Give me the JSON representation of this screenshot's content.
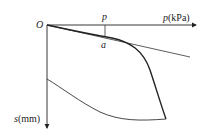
{
  "diagram": {
    "origin_label": "O",
    "x_axis": {
      "symbol": "p",
      "unit": "(kPa)"
    },
    "y_axis": {
      "symbol": "s",
      "unit": "(mm)"
    },
    "marker": {
      "load_label": "p",
      "point_label": "a"
    },
    "curves": [
      {
        "name": "loading-curve",
        "description": "settlement increases with load; linear up to point a, then steeply downward"
      },
      {
        "name": "tangent-line",
        "description": "straight line from origin through point a (linear stage)"
      },
      {
        "name": "unloading-curve",
        "description": "rebound curve from max settlement back to residual settlement on s-axis"
      }
    ],
    "colors": {
      "ink": "#222222"
    }
  }
}
